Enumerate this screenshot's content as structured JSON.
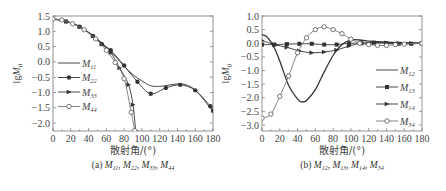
{
  "chart_data": [
    {
      "type": "line",
      "caption": "(a) M11, M22, M33, M44",
      "xlabel": "散射角/(°)",
      "ylabel": "lgMii",
      "xlim": [
        0,
        180
      ],
      "ylim": [
        -2.25,
        1.5
      ],
      "xticks": [
        0,
        20,
        40,
        60,
        80,
        100,
        120,
        140,
        160,
        180
      ],
      "yticks": [
        1.5,
        1.0,
        0.5,
        0.0,
        -0.5,
        -1.0,
        -1.5,
        -2.0
      ],
      "legend_position": "left-middle",
      "series": [
        {
          "name": "M11",
          "marker": "none",
          "x": [
            0,
            10,
            20,
            30,
            40,
            50,
            60,
            70,
            80,
            90,
            100,
            110,
            120,
            130,
            140,
            150,
            160,
            170,
            180
          ],
          "y": [
            1.4,
            1.37,
            1.28,
            1.15,
            0.97,
            0.75,
            0.48,
            0.18,
            -0.14,
            -0.42,
            -0.62,
            -0.78,
            -0.8,
            -0.76,
            -0.72,
            -0.75,
            -0.92,
            -1.25,
            -1.62
          ]
        },
        {
          "name": "M22",
          "marker": "filled-circle",
          "x": [
            0,
            15,
            30,
            45,
            55,
            65,
            80,
            95,
            110,
            127,
            143,
            160,
            177,
            180
          ],
          "y": [
            1.4,
            1.32,
            1.15,
            0.85,
            0.58,
            0.38,
            -0.12,
            -0.65,
            -1.04,
            -0.85,
            -0.75,
            -0.93,
            -1.45,
            -1.6
          ]
        },
        {
          "name": "M33",
          "marker": "filled-triangle",
          "x": [
            0,
            15,
            30,
            45,
            55,
            65,
            75,
            85,
            90,
            93
          ],
          "y": [
            1.4,
            1.32,
            1.15,
            0.85,
            0.58,
            0.3,
            -0.2,
            -0.75,
            -1.4,
            -2.25
          ]
        },
        {
          "name": "M44",
          "marker": "open-circle",
          "x": [
            0,
            10,
            22,
            35,
            48,
            60,
            70,
            80,
            88,
            92
          ],
          "y": [
            1.4,
            1.37,
            1.25,
            1.05,
            0.75,
            0.38,
            -0.02,
            -0.55,
            -1.65,
            -2.25
          ]
        }
      ]
    },
    {
      "type": "line",
      "caption": "(b) M12, M13, M14, M34",
      "xlabel": "散射角/(°)",
      "ylabel": "lgMij",
      "xlim": [
        0,
        180
      ],
      "ylim": [
        -3.2,
        1.0
      ],
      "xticks": [
        0,
        20,
        40,
        60,
        80,
        100,
        120,
        140,
        160,
        180
      ],
      "yticks": [
        1.0,
        0.5,
        0.0,
        -0.5,
        -1.0,
        -1.5,
        -2.0,
        -2.5,
        -3.0
      ],
      "legend_position": "right-middle",
      "series": [
        {
          "name": "M12",
          "marker": "none",
          "x": [
            0,
            5,
            10,
            15,
            20,
            30,
            40,
            45,
            50,
            60,
            70,
            80,
            90,
            100,
            110,
            120,
            140,
            160,
            180
          ],
          "y": [
            0.32,
            0.25,
            0.05,
            -0.25,
            -0.65,
            -1.55,
            -2.05,
            -2.15,
            -2.1,
            -1.7,
            -1.05,
            -0.45,
            -0.05,
            0.12,
            0.12,
            0.08,
            0.04,
            0.02,
            0.0
          ]
        },
        {
          "name": "M13",
          "marker": "filled-square",
          "x": [
            0,
            14,
            28,
            42,
            56,
            70,
            84,
            98,
            112,
            126,
            140,
            154,
            168,
            180
          ],
          "y": [
            -0.05,
            -0.05,
            -0.03,
            -0.02,
            -0.02,
            -0.05,
            -0.05,
            0.0,
            0.0,
            0.02,
            0.0,
            -0.02,
            -0.02,
            0.0
          ]
        },
        {
          "name": "M14",
          "marker": "filled-triangle",
          "x": [
            0,
            14,
            28,
            42,
            56,
            70,
            84,
            98,
            112,
            126,
            140,
            154,
            168,
            180
          ],
          "y": [
            0.1,
            -0.05,
            -0.15,
            -0.28,
            -0.35,
            -0.32,
            -0.25,
            -0.1,
            0.0,
            0.02,
            0.02,
            0.0,
            0.0,
            0.0
          ]
        },
        {
          "name": "M34",
          "marker": "open-circle",
          "x": [
            0,
            10,
            20,
            30,
            40,
            50,
            60,
            70,
            80,
            90,
            100,
            110,
            120,
            130,
            140,
            150,
            160,
            180
          ],
          "y": [
            -2.75,
            -2.6,
            -1.95,
            -1.2,
            -0.35,
            0.2,
            0.5,
            0.6,
            0.5,
            0.35,
            0.15,
            0.0,
            -0.05,
            -0.08,
            -0.08,
            -0.05,
            -0.03,
            0.0
          ]
        }
      ]
    }
  ]
}
